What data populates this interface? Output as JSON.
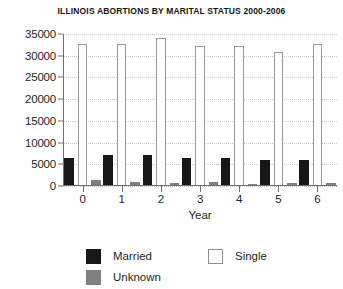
{
  "chart_data": {
    "type": "bar",
    "title": "ILLINOIS ABORTIONS BY MARITAL STATUS 2000-2006",
    "xlabel": "Year",
    "ylabel": "",
    "categories": [
      "0",
      "1",
      "2",
      "3",
      "4",
      "5",
      "6"
    ],
    "ylim": [
      0,
      35000
    ],
    "yticks": [
      0,
      5000,
      10000,
      15000,
      20000,
      25000,
      30000,
      35000
    ],
    "ytick_labels": [
      "0",
      "5000",
      "10000",
      "15000",
      "20000",
      "25000",
      "30000",
      "35000"
    ],
    "grid": true,
    "legend_position": "bottom",
    "series": [
      {
        "name": "Married",
        "color": "#171717",
        "values": [
          6500,
          7100,
          7100,
          6500,
          6400,
          6000,
          5900
        ]
      },
      {
        "name": "Single",
        "color": "#ffffff",
        "values": [
          32700,
          32800,
          34100,
          32300,
          32300,
          30900,
          32800
        ]
      },
      {
        "name": "Unknown",
        "color": "#808080",
        "values": [
          1500,
          900,
          800,
          900,
          400,
          600,
          700
        ]
      }
    ]
  },
  "legend": {
    "items": [
      {
        "label": "Married",
        "swatch": "black-square-swatch"
      },
      {
        "label": "Single",
        "swatch": "white-square-swatch"
      },
      {
        "label": "Unknown",
        "swatch": "gray-square-swatch"
      }
    ]
  }
}
